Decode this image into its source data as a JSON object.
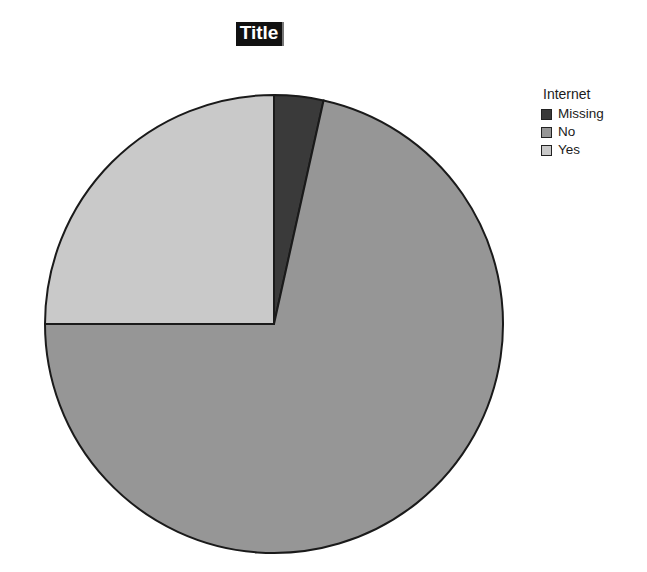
{
  "chart_data": {
    "type": "pie",
    "title": "Title",
    "title_selected": true,
    "legend_title": "Internet",
    "legend_position": "right-top",
    "grid": false,
    "categories": [
      "Missing",
      "No",
      "Yes"
    ],
    "values": [
      3.5,
      71.5,
      25.0
    ],
    "unit": "percent",
    "slices": [
      {
        "label": "Missing",
        "percent": 3.5,
        "start_angle_deg": 0.0,
        "end_angle_deg": 12.5,
        "color": "#3a3a3a"
      },
      {
        "label": "No",
        "percent": 71.5,
        "start_angle_deg": 12.5,
        "end_angle_deg": 270.0,
        "color": "#969696"
      },
      {
        "label": "Yes",
        "percent": 25.0,
        "start_angle_deg": 270.0,
        "end_angle_deg": 360.0,
        "color": "#c9c9c9"
      }
    ],
    "legend_entries": [
      {
        "label": "Missing",
        "color": "#3a3a3a"
      },
      {
        "label": "No",
        "color": "#969696"
      },
      {
        "label": "Yes",
        "color": "#c9c9c9"
      }
    ],
    "geometry": {
      "center_x": 274,
      "center_y": 324,
      "radius": 229
    },
    "xlabel": "",
    "ylabel": "",
    "outline_color": "#1a1a1a",
    "background": "#ffffff"
  }
}
